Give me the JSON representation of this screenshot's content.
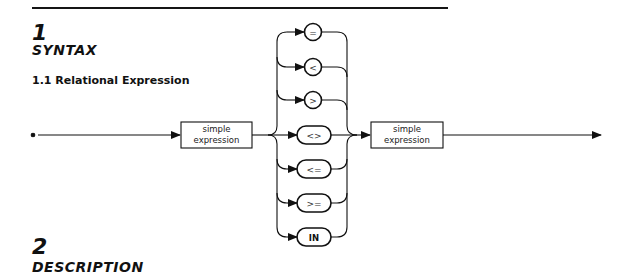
{
  "section1": {
    "number": "1",
    "title": "SYNTAX",
    "subsection": "1.1 Relational Expression"
  },
  "diagram": {
    "left_operand": {
      "line1": "simple",
      "line2": "expression"
    },
    "right_operand": {
      "line1": "simple",
      "line2": "expression"
    },
    "operators": [
      "=",
      "<",
      ">",
      "<>",
      "<=",
      ">=",
      "IN"
    ]
  },
  "section2": {
    "number": "2",
    "title": "DESCRIPTION"
  },
  "colors": {
    "ink": "#111111",
    "background": "#ffffff"
  }
}
